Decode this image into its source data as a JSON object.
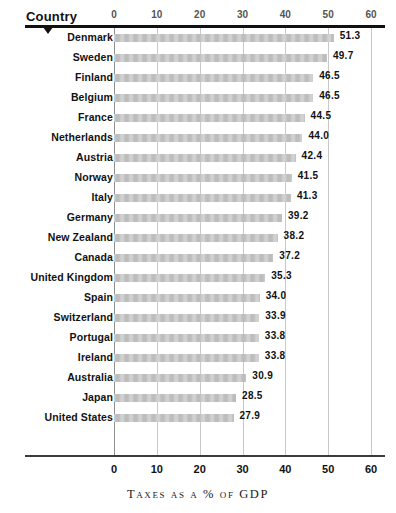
{
  "header": {
    "row_axis_title": "Country",
    "pointer_icon": "triangle-down-icon"
  },
  "axis": {
    "title": "Taxes as a % of GDP",
    "ticks": [
      "0",
      "10",
      "20",
      "30",
      "40",
      "50",
      "60"
    ]
  },
  "chart_data": {
    "type": "bar",
    "orientation": "horizontal",
    "title": "",
    "xlabel": "Taxes as a % of GDP",
    "ylabel": "Country",
    "xlim": [
      0,
      60
    ],
    "xticks": [
      0,
      10,
      20,
      30,
      40,
      50,
      60
    ],
    "grid": true,
    "legend": false,
    "bar_color": "#bdbdbd",
    "categories": [
      "Denmark",
      "Sweden",
      "Finland",
      "Belgium",
      "France",
      "Netherlands",
      "Austria",
      "Norway",
      "Italy",
      "Germany",
      "New Zealand",
      "Canada",
      "United Kingdom",
      "Spain",
      "Switzerland",
      "Portugal",
      "Ireland",
      "Australia",
      "Japan",
      "United States"
    ],
    "values": [
      51.3,
      49.7,
      46.5,
      46.5,
      44.5,
      44.0,
      42.4,
      41.5,
      41.3,
      39.2,
      38.2,
      37.2,
      35.3,
      34.0,
      33.9,
      33.8,
      33.8,
      30.9,
      28.5,
      27.9
    ],
    "data_labels": [
      "51.3",
      "49.7",
      "46.5",
      "46.5",
      "44.5",
      "44.0",
      "42.4",
      "41.5",
      "41.3",
      "39.2",
      "38.2",
      "37.2",
      "35.3",
      "34.0",
      "33.9",
      "33.8",
      "33.8",
      "30.9",
      "28.5",
      "27.9"
    ]
  }
}
